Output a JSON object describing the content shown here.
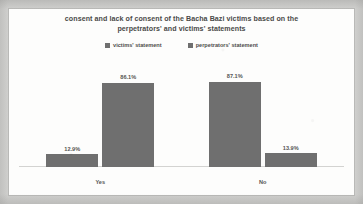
{
  "chart_data": {
    "type": "bar",
    "title": "consent and lack of consent of the Bacha Bazi victims based on the perpetrators' and victims' statements",
    "title_lines": [
      "consent and lack of consent of the Bacha Bazi victims based on the",
      "perpetrators' and victims' statements"
    ],
    "categories": [
      "Yes",
      "No"
    ],
    "series": [
      {
        "name": "victims' statement",
        "color": "#6f6f6f",
        "values": [
          12.9,
          87.1
        ],
        "labels": [
          "12.9%",
          "13.9%"
        ]
      },
      {
        "name": "perpetrators' statement",
        "color": "#6f6f6f",
        "values": [
          86.1,
          13.9
        ],
        "labels": [
          "86.1%",
          "87.1%"
        ]
      }
    ],
    "bars": [
      {
        "category": "Yes",
        "series": "victims' statement",
        "value": 12.9,
        "label": "12.9%"
      },
      {
        "category": "Yes",
        "series": "perpetrators' statement",
        "value": 86.1,
        "label": "86.1%"
      },
      {
        "category": "No",
        "series": "victims' statement",
        "value": 87.1,
        "label": "87.1%"
      },
      {
        "category": "No",
        "series": "perpetrators' statement",
        "value": 13.9,
        "label": "13.9%"
      }
    ],
    "xlabel": "",
    "ylabel": "",
    "ylim": [
      0,
      100
    ],
    "grid": false,
    "axis_visible": true,
    "legend_position": "top",
    "value_labels": true,
    "colors": {
      "bar": "#6f6f6f",
      "text": "#4a4a48",
      "frame": "#b9b9b7",
      "plot_background": "#fdfdfc",
      "page_background": "#cfcfcd",
      "axis": "#d3d3d1"
    }
  }
}
